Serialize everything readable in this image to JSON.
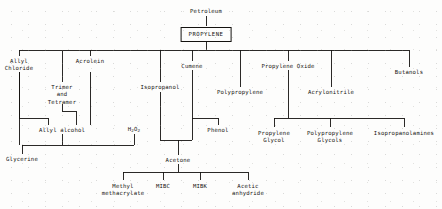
{
  "diagram": {
    "type": "process-flow-tree",
    "line_color": "#14120f",
    "background_color": "#fdfdfc",
    "nodes": {
      "petroleum": {
        "label": "Petroleum",
        "x": 206,
        "y": 8
      },
      "propylene": {
        "label": "PROPYLENE",
        "x": 206,
        "y": 27,
        "boxed": true
      },
      "allyl_chloride": {
        "label": "Allyl\nChloride",
        "x": 19,
        "y": 58
      },
      "trimer_tetramer": {
        "label": "Trimer\nand\nTetramer",
        "x": 62,
        "y": 84
      },
      "acrolein": {
        "label": "Acrolein",
        "x": 90,
        "y": 58
      },
      "isopropanol": {
        "label": "Isopropanol",
        "x": 160,
        "y": 84
      },
      "cumene": {
        "label": "Cumene",
        "x": 192,
        "y": 63
      },
      "polypropylene": {
        "label": "Polypropylene",
        "x": 240,
        "y": 89
      },
      "propylene_oxide": {
        "label": "Propylene Oxide",
        "x": 288,
        "y": 63
      },
      "acrylonitrile": {
        "label": "Acrylonitrile",
        "x": 331,
        "y": 89
      },
      "butanols": {
        "label": "Butanols",
        "x": 409,
        "y": 69
      },
      "allyl_alcohol": {
        "label": "Allyl alcohol",
        "x": 62,
        "y": 127
      },
      "hydrogen_peroxide": {
        "label": "H2O2",
        "html": "H<span class=\"sub\">2</span>O<span class=\"sub\">2</span>",
        "x": 134,
        "y": 127
      },
      "phenol": {
        "label": "Phenol",
        "x": 218,
        "y": 127
      },
      "glycerine": {
        "label": "Glycerine",
        "x": 22,
        "y": 156
      },
      "acetone": {
        "label": "Acetone",
        "x": 178,
        "y": 157
      },
      "propylene_glycol": {
        "label": "Propylene\nGlycol",
        "x": 274,
        "y": 130
      },
      "polypropylene_glycols": {
        "label": "Polypropylene\nGlycols",
        "x": 330,
        "y": 130
      },
      "isopropanolamines": {
        "label": "Isopropanolamines",
        "x": 404,
        "y": 130
      },
      "methyl_methacrylate": {
        "label": "Methyl\nmethacrylate",
        "x": 123,
        "y": 183
      },
      "mibc": {
        "label": "MIBC",
        "x": 163,
        "y": 183
      },
      "mibk": {
        "label": "MIBK",
        "x": 200,
        "y": 183
      },
      "acetic_anhydride": {
        "label": "Acetic\nanhydride",
        "x": 248,
        "y": 183
      }
    },
    "edges": [
      {
        "from": "petroleum",
        "to": "propylene"
      },
      {
        "from": "propylene",
        "to": "main-bus"
      },
      {
        "from": "main-bus",
        "to": "allyl_chloride"
      },
      {
        "from": "main-bus",
        "to": "trimer_tetramer"
      },
      {
        "from": "main-bus",
        "to": "acrolein"
      },
      {
        "from": "main-bus",
        "to": "isopropanol"
      },
      {
        "from": "main-bus",
        "to": "cumene"
      },
      {
        "from": "main-bus",
        "to": "polypropylene"
      },
      {
        "from": "main-bus",
        "to": "propylene_oxide"
      },
      {
        "from": "main-bus",
        "to": "acrylonitrile"
      },
      {
        "from": "main-bus",
        "to": "butanols"
      },
      {
        "from": "allyl_chloride",
        "to": "allyl_alcohol"
      },
      {
        "from": "trimer_tetramer",
        "to": "allyl_alcohol"
      },
      {
        "from": "allyl_chloride",
        "to": "glycerine"
      },
      {
        "from": "allyl_alcohol",
        "to": "glycerine"
      },
      {
        "from": "hydrogen_peroxide",
        "to": "glycerine"
      },
      {
        "from": "isopropanol",
        "to": "acetone"
      },
      {
        "from": "cumene",
        "to": "acetone"
      },
      {
        "from": "cumene",
        "to": "phenol"
      },
      {
        "from": "acetone",
        "to": "methyl_methacrylate"
      },
      {
        "from": "acetone",
        "to": "mibc"
      },
      {
        "from": "acetone",
        "to": "mibk"
      },
      {
        "from": "acetone",
        "to": "acetic_anhydride"
      },
      {
        "from": "propylene_oxide",
        "to": "propylene_glycol"
      },
      {
        "from": "propylene_oxide",
        "to": "polypropylene_glycols"
      },
      {
        "from": "propylene_oxide",
        "to": "isopropanolamines"
      }
    ]
  }
}
